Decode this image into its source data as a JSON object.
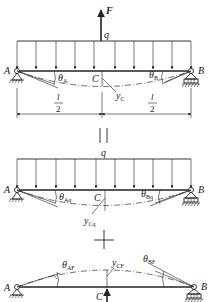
{
  "diagram": {
    "type": "superposition-of-beam-deflections",
    "colors": {
      "line": "#222222",
      "background": "#ffffff"
    },
    "panel_top": {
      "force_label": "F",
      "load_label": "q",
      "support_left": "A",
      "support_right": "B",
      "midpoint": "C",
      "angle_left": {
        "base": "θ",
        "sub": "A"
      },
      "angle_right": {
        "base": "θ",
        "sub": "B"
      },
      "deflection": {
        "base": "y",
        "sub": "C"
      },
      "span_left": {
        "num": "l",
        "den": "2"
      },
      "span_right": {
        "num": "l",
        "den": "2"
      }
    },
    "equals_sign": "||",
    "panel_mid": {
      "load_label": "q",
      "support_left": "A",
      "support_right": "B",
      "midpoint": "C",
      "angle_left": {
        "base": "θ",
        "sub": "Aq"
      },
      "angle_right": {
        "base": "θ",
        "sub": "Bq"
      },
      "deflection": {
        "base": "y",
        "sub": "Cq"
      }
    },
    "plus_sign": "+",
    "panel_bottom": {
      "support_left": "A",
      "support_right": "B",
      "midpoint": "C",
      "angle_left": {
        "base": "θ",
        "sub": "AF"
      },
      "angle_right": {
        "base": "θ",
        "sub": "BF"
      },
      "deflection": {
        "base": "y",
        "sub": "CF"
      }
    }
  }
}
